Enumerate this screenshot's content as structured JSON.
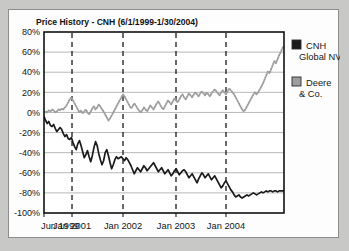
{
  "card": {
    "background_color": "#fdfdfd",
    "border_color": "#8d8d8d"
  },
  "page": {
    "background_color": "#c8c8c6"
  },
  "chart_data": {
    "type": "line",
    "title": "Price History - CNH (6/1/1999-1/30/2004)",
    "xlabel": "",
    "ylabel": "",
    "ylim": [
      -100,
      80
    ],
    "ytick_values": [
      80,
      60,
      40,
      20,
      0,
      -20,
      -40,
      -60,
      -80,
      -100
    ],
    "ytick_labels": [
      "80%",
      "60%",
      "40%",
      "20%",
      "0%",
      "-20%",
      "-40%",
      "-60%",
      "-80%",
      "-100%"
    ],
    "xtick_labels": [
      "Jun 1999",
      "Jan 2001",
      "Jan 2002",
      "Jan 2003",
      "Jan 2004"
    ],
    "xtick_positions": [
      0,
      0.1167,
      0.3292,
      0.55,
      0.7583
    ],
    "xlim_start": "1999-06-01",
    "xlim_end": "2004-01-30",
    "grid": "horizontal-solid-and-vertical-dashed",
    "legend_position": "right",
    "legend": [
      {
        "name": "CNH Global NV",
        "line1": "CNH",
        "line2": "Global NV",
        "color": "#1a1a1a",
        "marker": "filled-square"
      },
      {
        "name": "Deere & Co.",
        "line1": "Deere",
        "line2": "& Co.",
        "color": "#9e9e9e",
        "marker": "outlined-square"
      }
    ],
    "series": [
      {
        "name": "CNH Global NV",
        "color": "#1a1a1a",
        "style": "solid",
        "values": [
          -4,
          -8,
          -11,
          -9,
          -13,
          -14,
          -12,
          -16,
          -19,
          -17,
          -15,
          -17,
          -21,
          -24,
          -22,
          -26,
          -27,
          -25,
          -30,
          -34,
          -37,
          -31,
          -28,
          -33,
          -39,
          -45,
          -42,
          -38,
          -44,
          -49,
          -43,
          -35,
          -29,
          -33,
          -41,
          -47,
          -52,
          -48,
          -40,
          -37,
          -43,
          -50,
          -56,
          -52,
          -47,
          -44,
          -46,
          -45,
          -44,
          -46,
          -48,
          -45,
          -47,
          -50,
          -53,
          -57,
          -61,
          -58,
          -55,
          -57,
          -59,
          -56,
          -53,
          -55,
          -58,
          -56,
          -54,
          -52,
          -50,
          -53,
          -56,
          -59,
          -57,
          -55,
          -58,
          -61,
          -59,
          -57,
          -60,
          -63,
          -61,
          -58,
          -56,
          -59,
          -62,
          -60,
          -58,
          -57,
          -59,
          -62,
          -65,
          -63,
          -61,
          -64,
          -67,
          -70,
          -66,
          -63,
          -60,
          -62,
          -65,
          -63,
          -61,
          -64,
          -67,
          -65,
          -63,
          -66,
          -69,
          -72,
          -75,
          -73,
          -70,
          -68,
          -71,
          -74,
          -77,
          -79,
          -82,
          -84,
          -83,
          -82,
          -84,
          -85,
          -84,
          -83,
          -82,
          -83,
          -82,
          -81,
          -80,
          -81,
          -82,
          -81,
          -80,
          -79,
          -80,
          -79,
          -78,
          -79,
          -78,
          -78,
          -79,
          -78,
          -78,
          -79,
          -78,
          -78,
          -78,
          -78
        ]
      },
      {
        "name": "Deere & Co.",
        "color": "#9e9e9e",
        "style": "dotted",
        "values": [
          0,
          1,
          0,
          2,
          1,
          3,
          2,
          0,
          1,
          3,
          2,
          4,
          3,
          5,
          7,
          10,
          13,
          15,
          12,
          9,
          6,
          3,
          0,
          2,
          -1,
          1,
          3,
          0,
          -2,
          1,
          4,
          6,
          3,
          5,
          8,
          6,
          3,
          1,
          -2,
          -5,
          -8,
          -6,
          -3,
          0,
          3,
          6,
          9,
          12,
          15,
          18,
          16,
          13,
          10,
          7,
          4,
          6,
          9,
          7,
          4,
          2,
          0,
          2,
          5,
          3,
          1,
          4,
          7,
          5,
          3,
          6,
          9,
          11,
          8,
          5,
          3,
          6,
          9,
          12,
          10,
          8,
          11,
          14,
          12,
          10,
          13,
          16,
          18,
          15,
          13,
          16,
          19,
          17,
          15,
          18,
          20,
          18,
          16,
          19,
          21,
          19,
          17,
          20,
          18,
          16,
          19,
          21,
          23,
          21,
          19,
          17,
          20,
          22,
          20,
          18,
          21,
          24,
          22,
          20,
          18,
          15,
          12,
          9,
          6,
          3,
          1,
          3,
          6,
          9,
          12,
          15,
          18,
          20,
          18,
          20,
          23,
          26,
          29,
          33,
          37,
          41,
          39,
          43,
          47,
          51,
          49,
          53,
          57,
          60,
          64,
          66
        ]
      }
    ]
  }
}
